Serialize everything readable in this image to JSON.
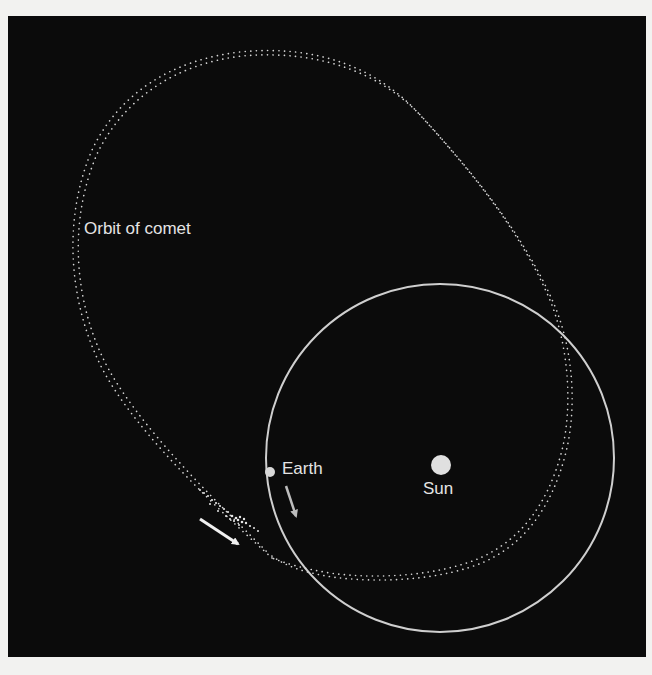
{
  "figure": {
    "background_color": "#0b0b0b",
    "page_color": "#f2f2f0",
    "labels": {
      "orbit": "Orbit of comet",
      "earth": "Earth",
      "sun": "Sun"
    },
    "earth_orbit": {
      "center": [
        440,
        458
      ],
      "radius": 174,
      "color": "#cfcfcf"
    },
    "sun": {
      "center": [
        441,
        465
      ],
      "radius": 10,
      "color": "#e0e0e0"
    },
    "earth": {
      "center": [
        270,
        472
      ],
      "radius": 5,
      "color": "#d8d8d8"
    },
    "arrows": [
      {
        "name": "comet-direction",
        "from": [
          228,
          522
        ],
        "to": [
          240,
          546
        ],
        "color": "#f0f0f0"
      },
      {
        "name": "earth-direction",
        "from": [
          287,
          482
        ],
        "to": [
          296,
          512
        ],
        "color": "#bdbdbd"
      }
    ]
  }
}
